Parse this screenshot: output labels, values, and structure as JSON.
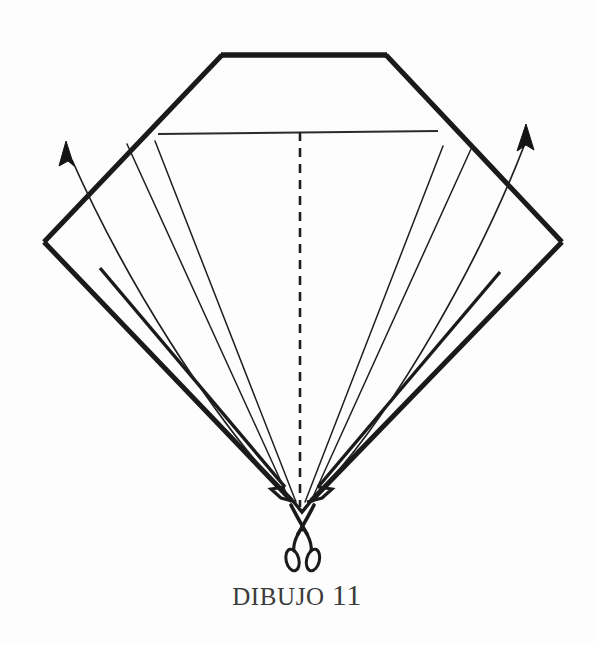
{
  "document": {
    "kind": "instruction-figure",
    "caption_label": "DIBUJO",
    "caption_number": "11",
    "caption_full": "DIBUJO 11"
  },
  "palette": {
    "background": "#fdfdfd",
    "ink": "#1a1a1a",
    "ink_soft": "#2b2b2b",
    "caption": "#3b3b3b"
  },
  "figure": {
    "canvas": {
      "width": 594,
      "height": 645
    },
    "outline": {
      "name": "truncated-diamond-outline",
      "stroke_width": 5,
      "points": [
        {
          "label": "top-left-corner",
          "x": 222,
          "y": 55
        },
        {
          "label": "top-right-corner",
          "x": 386,
          "y": 55
        },
        {
          "label": "right-vertex",
          "x": 562,
          "y": 242
        },
        {
          "label": "bottom-tip",
          "x": 300,
          "y": 508
        },
        {
          "label": "left-vertex",
          "x": 44,
          "y": 242
        }
      ]
    },
    "horizontal_crease": {
      "name": "upper-horizontal-crease",
      "x1": 158,
      "y1": 134,
      "x2": 438,
      "y2": 131,
      "stroke_width": 2
    },
    "center_fold": {
      "name": "center-dashed-fold",
      "x1": 300,
      "y1": 131,
      "x2": 300,
      "y2": 508,
      "dash": "9 7",
      "stroke_width": 2.4
    },
    "fan_creases": [
      {
        "name": "fan-crease-left-outer",
        "x1": 155,
        "y1": 141,
        "x2": 296,
        "y2": 503
      },
      {
        "name": "fan-crease-left-inner",
        "x1": 127,
        "y1": 143,
        "x2": 290,
        "y2": 500
      },
      {
        "name": "fan-crease-right-inner",
        "x1": 443,
        "y1": 145,
        "x2": 305,
        "y2": 503
      },
      {
        "name": "fan-crease-right-outer",
        "x1": 470,
        "y1": 148,
        "x2": 310,
        "y2": 500
      }
    ],
    "arrows": [
      {
        "name": "arrow-left-unfold",
        "direction": "up-left",
        "path": "M 270 478 C 200 400 120 280 70 156",
        "head": {
          "x": 66,
          "y": 143
        }
      },
      {
        "name": "arrow-right-unfold",
        "direction": "up-right",
        "path": "M 327 478 C 400 400 480 260 527 140",
        "head": {
          "x": 524,
          "y": 127
        }
      }
    ],
    "scissors": {
      "name": "scissors-icon",
      "pivot": {
        "x": 302,
        "y": 530
      },
      "blade_tips": [
        {
          "x": 291,
          "y": 506
        },
        {
          "x": 315,
          "y": 506
        }
      ],
      "handles": [
        {
          "cx": 294,
          "cy": 559,
          "rx": 7,
          "ry": 11,
          "rotate": -12
        },
        {
          "cx": 313,
          "cy": 559,
          "rx": 7,
          "ry": 11,
          "rotate": 12
        }
      ]
    },
    "notches": [
      {
        "name": "notch-left",
        "x": 277,
        "y": 492
      },
      {
        "name": "notch-right",
        "x": 323,
        "y": 492
      }
    ]
  }
}
